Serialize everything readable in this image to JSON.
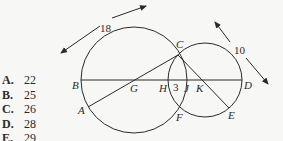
{
  "choices": [
    {
      "letter": "A.",
      "value": "22"
    },
    {
      "letter": "B.",
      "value": "25"
    },
    {
      "letter": "C.",
      "value": "26"
    },
    {
      "letter": "D.",
      "value": "28"
    },
    {
      "letter": "E.",
      "value": "29"
    }
  ],
  "diagram": {
    "labels": {
      "A": "A",
      "B": "B",
      "C": "C",
      "D": "D",
      "E": "E",
      "F": "F",
      "G": "G",
      "H": "H",
      "J": "J",
      "K": "K"
    },
    "measures": {
      "large_diameter": "18",
      "small_diameter": "10",
      "overlap": "3"
    },
    "stroke_color": "#2a2a2a"
  }
}
